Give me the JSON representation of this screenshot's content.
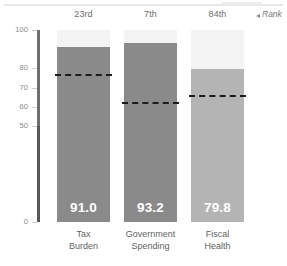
{
  "rank_legend": {
    "text": "Rank",
    "arrow_icon": "triangle-left-icon"
  },
  "colors": {
    "bar_dark": "#8a8a8a",
    "bar_light": "#b4b4b4",
    "track": "#f4f4f4",
    "axis": "#6f6f6f",
    "dash": "#1c1c1c",
    "tick_text": "#8b8b8b",
    "category_text": "#5f5f5f",
    "rank_text": "#6d6d6d",
    "value_text": "#ffffff",
    "background": "#ffffff"
  },
  "chart_data": {
    "type": "bar",
    "title": "",
    "xlabel": "",
    "ylabel": "",
    "ylim": [
      0,
      100
    ],
    "grid": false,
    "legend_position": "top-right",
    "categories": [
      "Tax Burden",
      "Government Spending",
      "Fiscal Health"
    ],
    "category_lines": [
      [
        "Tax",
        "Burden"
      ],
      [
        "Government",
        "Spending"
      ],
      [
        "Fiscal",
        "Health"
      ]
    ],
    "values": [
      91.0,
      93.2,
      79.8
    ],
    "value_labels": [
      "91.0",
      "93.2",
      "79.8"
    ],
    "ranks": [
      "23rd",
      "7th",
      "84th"
    ],
    "benchmark_label": "",
    "benchmarks": [
      77.0,
      62.5,
      66.0
    ],
    "bar_colors": [
      "#8a8a8a",
      "#8a8a8a",
      "#b4b4b4"
    ],
    "ytick_values": [
      100,
      80,
      70,
      60,
      50,
      0
    ],
    "ytick_labels": [
      "100",
      "80",
      "70",
      "60",
      "50",
      "0"
    ],
    "series": [
      {
        "name": "Score",
        "values": [
          91.0,
          93.2,
          79.8
        ]
      },
      {
        "name": "Benchmark",
        "values": [
          77.0,
          62.5,
          66.0
        ]
      }
    ]
  }
}
